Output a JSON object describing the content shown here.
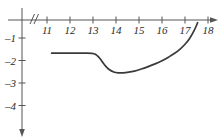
{
  "chart_data": {
    "type": "line",
    "title": "",
    "subtitle": "",
    "xlabel": "",
    "ylabel": "",
    "xlim": [
      10.6,
      18.4
    ],
    "ylim": [
      -4.9,
      0.2
    ],
    "xticks": [
      11,
      12,
      13,
      14,
      15,
      16,
      17,
      18
    ],
    "xtick_labels": [
      "11",
      "12",
      "13",
      "14",
      "15",
      "16",
      "17",
      "18"
    ],
    "yticks": [
      -1,
      -2,
      -3,
      -4
    ],
    "ytick_labels": [
      "–1",
      "–2",
      "–3",
      "–4"
    ],
    "grid": false,
    "legend": false,
    "axis_break": "//",
    "axis_break_x": 10.75,
    "line_color": "#3a3a3a",
    "axis_color": "#555555",
    "series": [
      {
        "name": "curve",
        "x": [
          11.2,
          11.6,
          12.0,
          12.4,
          12.7,
          12.95,
          13.1,
          13.25,
          13.4,
          13.55,
          13.7,
          13.9,
          14.1,
          14.3,
          14.55,
          14.8,
          15.1,
          15.4,
          15.7,
          16.0,
          16.3,
          16.55,
          16.8,
          17.0,
          17.2,
          17.4,
          17.55
        ],
        "y": [
          -1.67,
          -1.67,
          -1.67,
          -1.67,
          -1.67,
          -1.68,
          -1.72,
          -1.85,
          -2.05,
          -2.25,
          -2.4,
          -2.51,
          -2.55,
          -2.55,
          -2.52,
          -2.47,
          -2.38,
          -2.27,
          -2.15,
          -2.01,
          -1.84,
          -1.68,
          -1.48,
          -1.28,
          -1.02,
          -0.66,
          -0.32
        ]
      }
    ],
    "annotations": {
      "flat_level": -1.67,
      "minimum_x": 14.2,
      "minimum_y": -2.55,
      "end_x": 17.55,
      "end_y": -0.32
    }
  },
  "axes": {
    "x_arrow": "right",
    "y_arrow": "down"
  }
}
